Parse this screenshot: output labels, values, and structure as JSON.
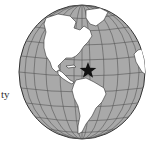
{
  "figure": {
    "type": "orthographic-globe-map",
    "label_fragment": "ty",
    "marker": {
      "icon": "star-icon",
      "description": "star marking location in Caribbean / north of South America"
    },
    "landmasses": [
      "North America",
      "Greenland",
      "Central America",
      "South America",
      "Africa (edge)"
    ],
    "colors": {
      "ocean": "#a9a9a9",
      "land": "#ffffff",
      "grid": "#555555",
      "outline": "#333333",
      "marker": "#111111"
    }
  }
}
